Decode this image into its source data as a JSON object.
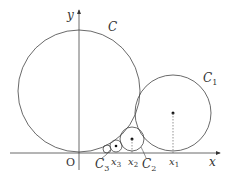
{
  "diagram": {
    "axes": {
      "x_label": "x",
      "y_label": "y",
      "origin_label": "O"
    },
    "circles": [
      {
        "id": "C",
        "label": "C",
        "cx": 79,
        "cy": 91,
        "r": 61,
        "label_x": 108,
        "label_y": 30
      },
      {
        "id": "C1",
        "label": "C",
        "sub": "1",
        "cx": 173,
        "cy": 113,
        "r": 38,
        "label_x": 203,
        "label_y": 79,
        "point_label": "x",
        "point_sub": "1"
      },
      {
        "id": "C2",
        "label": "C",
        "sub": "2",
        "cx": 132,
        "cy": 139,
        "r": 12,
        "label_x": 143,
        "label_y": 167,
        "point_label": "x",
        "point_sub": "2"
      },
      {
        "id": "C3",
        "label": "C",
        "sub": "3",
        "cx": 116,
        "cy": 146,
        "r": 6,
        "label_x": 95,
        "label_y": 168,
        "point_label": "x",
        "point_sub": "3"
      },
      {
        "id": "C4",
        "cx": 107,
        "cy": 149,
        "r": 4
      }
    ]
  }
}
